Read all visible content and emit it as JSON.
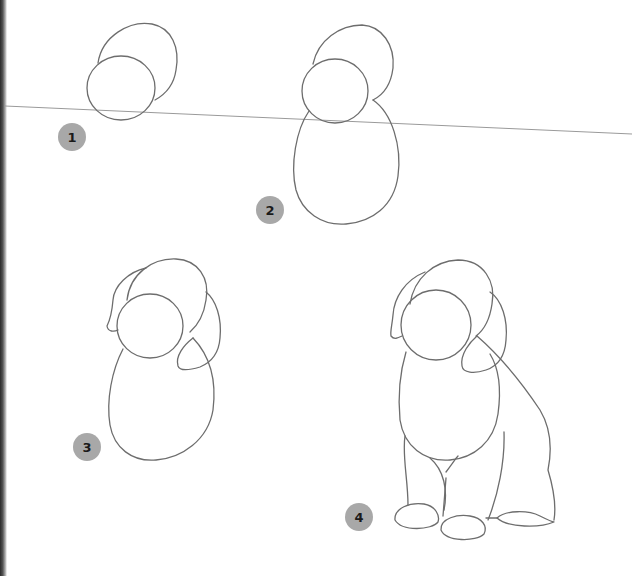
{
  "page": {
    "background_color": "#ffffff",
    "line_color": "#6d6d6d",
    "badge_color": "#a8a8a8"
  },
  "steps": [
    {
      "number": "1",
      "description": "Head ovals"
    },
    {
      "number": "2",
      "description": "Head ovals with body oval"
    },
    {
      "number": "3",
      "description": "Ears added"
    },
    {
      "number": "4",
      "description": "Legs, paws and hindquarters added"
    }
  ]
}
